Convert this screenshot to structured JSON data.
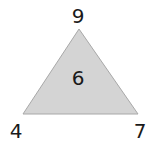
{
  "diagram": {
    "shape": "triangle",
    "fill_color": "#d4d4d4",
    "stroke_color": "#a8a8a8",
    "center_value": "6",
    "vertices": {
      "top": "9",
      "bottom_left": "4",
      "bottom_right": "7"
    }
  }
}
